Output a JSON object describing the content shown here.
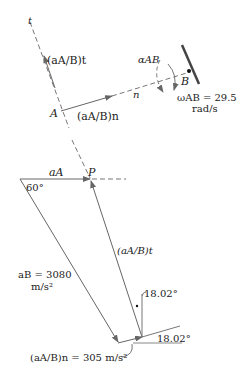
{
  "diagram": {
    "upper": {
      "t_axis_label": "t",
      "point_A": "A",
      "point_B": "B",
      "n_label": "n",
      "a_AB_t_label": "(aA/B)t",
      "a_AB_n_label": "(aA/B)n",
      "alpha_label": "αAB",
      "omega_label": "ωAB = 29.5",
      "omega_units": "rad/s"
    },
    "triangle": {
      "point_P": "P",
      "a_A_label": "aA",
      "angle_60": "60°",
      "a_B_label": "aB = 3080",
      "a_B_units": "m/s²",
      "a_AB_t_label": "(aA/B)t",
      "a_AB_n_label": "(aA/B)n = 305 m/s²",
      "angle_top": "18.02°",
      "angle_bottom": "18.02°"
    },
    "colors": {
      "line": "#555555",
      "text": "#222222",
      "wall": "#444444"
    }
  }
}
